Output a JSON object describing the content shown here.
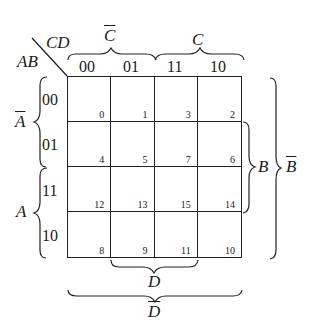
{
  "kmap": {
    "corner": {
      "row_vars": "AB",
      "col_vars": "CD"
    },
    "col_codes": [
      "00",
      "01",
      "11",
      "10"
    ],
    "row_codes": [
      "00",
      "01",
      "11",
      "10"
    ],
    "cells": [
      [
        "0",
        "1",
        "3",
        "2"
      ],
      [
        "4",
        "5",
        "7",
        "6"
      ],
      [
        "12",
        "13",
        "15",
        "14"
      ],
      [
        "8",
        "9",
        "11",
        "10"
      ]
    ],
    "brackets": {
      "top_left": "C",
      "top_left_negated": true,
      "top_right": "C",
      "top_right_negated": false,
      "left_top": "A",
      "left_top_negated": true,
      "left_bottom": "A",
      "left_bottom_negated": false,
      "right_inner": "B",
      "right_inner_negated": false,
      "right_outer": "B",
      "right_outer_negated": true,
      "bottom_inner": "D",
      "bottom_inner_negated": false,
      "bottom_outer": "D",
      "bottom_outer_negated": true
    }
  }
}
